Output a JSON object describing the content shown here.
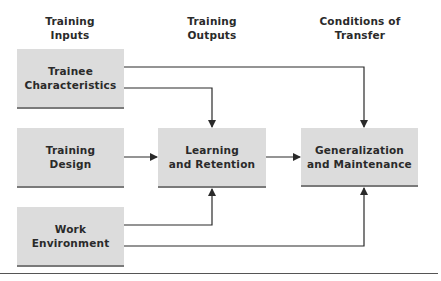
{
  "diagram": {
    "columns": [
      {
        "line1": "Training",
        "line2": "Inputs"
      },
      {
        "line1": "Training",
        "line2": "Outputs"
      },
      {
        "line1": "Conditions of",
        "line2": "Transfer"
      }
    ],
    "nodes": {
      "trainee_characteristics": {
        "line1": "Trainee",
        "line2": "Characteristics"
      },
      "training_design": {
        "line1": "Training",
        "line2": "Design"
      },
      "work_environment": {
        "line1": "Work",
        "line2": "Environment"
      },
      "learning_retention": {
        "line1": "Learning",
        "line2": "and Retention"
      },
      "generalization_maintenance": {
        "line1": "Generalization",
        "line2": "and Maintenance"
      }
    },
    "edges": [
      {
        "from": "Trainee Characteristics",
        "to": "Learning and Retention"
      },
      {
        "from": "Trainee Characteristics",
        "to": "Generalization and Maintenance"
      },
      {
        "from": "Training Design",
        "to": "Learning and Retention"
      },
      {
        "from": "Work Environment",
        "to": "Learning and Retention"
      },
      {
        "from": "Work Environment",
        "to": "Generalization and Maintenance"
      },
      {
        "from": "Learning and Retention",
        "to": "Generalization and Maintenance"
      }
    ],
    "colors": {
      "box_fill": "#dcdcdc",
      "box_shadow": "#7a7a7a",
      "line": "#2a2a2a"
    }
  }
}
